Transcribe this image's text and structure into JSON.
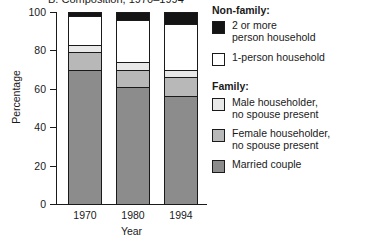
{
  "chart_data": {
    "type": "bar",
    "title": "B. Composition, 1970–1994",
    "xlabel": "Year",
    "ylabel": "Percentage",
    "ylim": [
      0,
      100
    ],
    "yticks": [
      0,
      20,
      40,
      60,
      80,
      100
    ],
    "grid": false,
    "stacked": true,
    "legend_position": "right",
    "categories": [
      "1970",
      "1980",
      "1994"
    ],
    "series": [
      {
        "name": "Married couple",
        "group": "Family",
        "color": "#8c8c8c",
        "values": [
          70,
          61,
          56
        ]
      },
      {
        "name": "Female householder, no spouse present",
        "group": "Family",
        "color": "#b8b8b8",
        "values": [
          9,
          9,
          10
        ]
      },
      {
        "name": "Male householder, no spouse present",
        "group": "Family",
        "color": "#e8e8e8",
        "values": [
          4,
          4,
          4
        ]
      },
      {
        "name": "1-person household",
        "group": "Non-family",
        "color": "#ffffff",
        "values": [
          15,
          22,
          24
        ]
      },
      {
        "name": "2 or more person household",
        "group": "Non-family",
        "color": "#141414",
        "values": [
          2,
          4,
          6
        ]
      }
    ]
  },
  "axis": {
    "y_tick_labels": [
      "0",
      "20",
      "40",
      "60",
      "80",
      "100"
    ],
    "y_title": "Percentage",
    "x_tick_labels": [
      "1970",
      "1980",
      "1994"
    ],
    "x_title": "Year"
  },
  "legend": {
    "heading_nonfamily": "Non-family:",
    "heading_family": "Family:",
    "items": [
      {
        "label": "2 or more\nperson household",
        "color": "#141414"
      },
      {
        "label": "1-person household",
        "color": "#ffffff"
      },
      {
        "label": "Male householder,\nno spouse present",
        "color": "#e8e8e8"
      },
      {
        "label": "Female householder,\nno spouse present",
        "color": "#b8b8b8"
      },
      {
        "label": "Married couple",
        "color": "#8c8c8c"
      }
    ]
  },
  "colors": {
    "axis": "#1a1a1a",
    "text": "#1a1a1a",
    "background": "#ffffff"
  }
}
